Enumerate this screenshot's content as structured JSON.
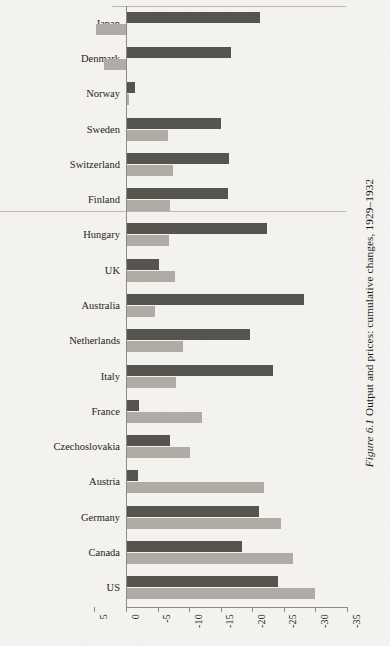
{
  "figure": {
    "label": "Figure 6.1",
    "caption": "Output and prices: cumulative changes, 1929–1932",
    "full_caption": "Figure 6.1 Output and prices: cumulative changes, 1929–1932"
  },
  "colors": {
    "page_background": "#f3f2ee",
    "series_output": "#56544f",
    "series_prices": "#aeaca4",
    "axis": "#8c8a84",
    "text": "#1e1d1b"
  },
  "chart_data": {
    "type": "bar",
    "orientation": "horizontal",
    "title": "Figure 6.1 Output and prices: cumulative changes, 1929–1932",
    "xlabel": "",
    "ylabel": "",
    "xlim": [
      5,
      -35
    ],
    "axis_reversed": true,
    "grid": false,
    "legend_position": "none",
    "xticks": [
      5,
      0,
      -5,
      -10,
      -15,
      -20,
      -25,
      -30,
      -35
    ],
    "xtick_labels": [
      "5",
      "0",
      "-5",
      "-10",
      "-15",
      "-20",
      "-25",
      "-30",
      "-35"
    ],
    "categories": [
      "Japan",
      "Denmark",
      "Norway",
      "Sweden",
      "Switzerland",
      "Finland",
      "Hungary",
      "UK",
      "Australia",
      "Netherlands",
      "Italy",
      "France",
      "Czechoslovakia",
      "Austria",
      "Germany",
      "Canada",
      "US"
    ],
    "series": [
      {
        "name": "Output",
        "color": "#56544f",
        "values": [
          -21.2,
          -16.7,
          -1.5,
          -15.0,
          -16.3,
          -16.2,
          -22.4,
          -5.3,
          -28.2,
          -19.6,
          -23.3,
          -2.1,
          -6.9,
          -1.9,
          -21.0,
          -18.4,
          -24.0
        ]
      },
      {
        "name": "Prices",
        "color": "#aeaca4",
        "values": [
          4.8,
          3.5,
          -0.4,
          -6.7,
          -7.4,
          -7.0,
          -6.8,
          -7.7,
          -4.6,
          -9.0,
          -7.9,
          -12.0,
          -10.1,
          -21.9,
          -24.6,
          -26.4,
          -30.0
        ]
      }
    ]
  }
}
